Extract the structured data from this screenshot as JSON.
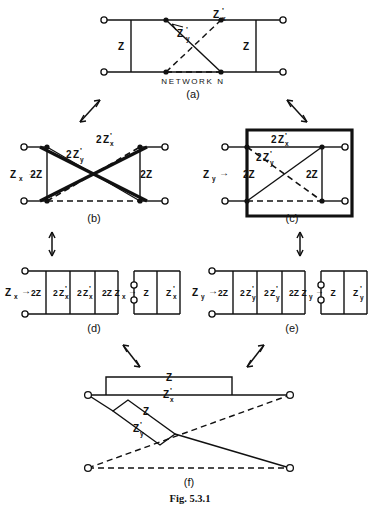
{
  "figure": {
    "caption": "Fig. 5.3.1",
    "network_name": "NETWORK N",
    "ink_color": "#111111",
    "background_color": "#ffffff"
  },
  "symbols": {
    "Z": "Z",
    "Zx": "Z",
    "Zy": "Z",
    "sub_x": "x",
    "sub_y": "y",
    "prime": "'",
    "two": "2",
    "arrow_right": "→"
  },
  "panels": [
    {
      "id": "a",
      "label": "(a)",
      "title": "NETWORK N",
      "elements": [
        {
          "name": "series-left",
          "text": "Z"
        },
        {
          "name": "series-right",
          "text": "Z"
        },
        {
          "name": "lattice-arm-x",
          "text": "Z'x"
        },
        {
          "name": "lattice-arm-y",
          "text": "Z'y"
        }
      ]
    },
    {
      "id": "b",
      "label": "(b)",
      "port_label": "Zx",
      "elements": [
        {
          "name": "shunt-left",
          "text": "2Z"
        },
        {
          "name": "shunt-right",
          "text": "2Z"
        },
        {
          "name": "cross-arm-x",
          "text": "2Z'x"
        },
        {
          "name": "cross-arm-y",
          "text": "2Z'y"
        }
      ]
    },
    {
      "id": "c",
      "label": "(c)",
      "port_label": "Zy",
      "elements": [
        {
          "name": "shunt-left",
          "text": "2Z"
        },
        {
          "name": "shunt-right",
          "text": "2Z"
        },
        {
          "name": "cross-arm-x",
          "text": "2Z'x"
        },
        {
          "name": "cross-arm-y",
          "text": "2Z'y"
        }
      ]
    },
    {
      "id": "d",
      "label": "(d)",
      "port_label": "Zx",
      "left_branches": [
        "2Z",
        "2Z'x",
        "2Z'x",
        "2Z"
      ],
      "right_branches": [
        "Z",
        "Z'x"
      ]
    },
    {
      "id": "e",
      "label": "(e)",
      "port_label": "Zy",
      "left_branches": [
        "2Z",
        "2Z'y",
        "2Z'y",
        "2Z"
      ],
      "right_branches": [
        "Z",
        "Z'y"
      ]
    },
    {
      "id": "f",
      "label": "(f)",
      "elements": [
        {
          "name": "bridge-box",
          "text": "Z"
        },
        {
          "name": "series-arm",
          "text": "Z'x"
        },
        {
          "name": "diagonal-box",
          "text": "Z"
        },
        {
          "name": "diagonal-arm",
          "text": "Z'y"
        }
      ]
    }
  ],
  "labels": {
    "a": "(a)",
    "b": "(b)",
    "c": "(c)",
    "d": "(d)",
    "e": "(e)",
    "f": "(f)",
    "Z": "Z",
    "twoZ": "2Z",
    "two": "2",
    "Zchar": "Z",
    "x": "x",
    "y": "y",
    "prime": "'",
    "arrow": "→",
    "network": "NETWORK N",
    "caption": "Fig. 5.3.1"
  }
}
